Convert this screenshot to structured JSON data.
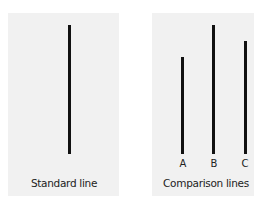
{
  "diagram": {
    "colors": {
      "panel_background": "#f1f1f1",
      "line_color": "#111111",
      "text_color": "#222222"
    },
    "standard_panel": {
      "caption": "Standard line",
      "line": {
        "x": 69,
        "top": 25,
        "bottom": 154
      }
    },
    "comparison_panel": {
      "caption": "Comparison lines",
      "lines": [
        {
          "label": "A",
          "x": 182,
          "top": 57,
          "bottom": 154
        },
        {
          "label": "B",
          "x": 213,
          "top": 25,
          "bottom": 154
        },
        {
          "label": "C",
          "x": 245,
          "top": 41,
          "bottom": 154
        }
      ]
    }
  }
}
